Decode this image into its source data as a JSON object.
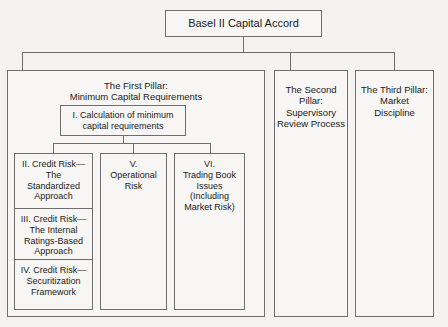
{
  "diagram": {
    "title": "Basel II Capital Accord",
    "root": {
      "label": "Basel II Capital Accord"
    },
    "pillars": [
      {
        "id": "first-pillar",
        "label": "The First Pillar:\nMinimum Capital Requirements",
        "line1": "The First Pillar:",
        "line2": "Minimum Capital Requirements",
        "children": {
          "calculation": {
            "line1": "I. Calculation of minimum",
            "line2": "capital requirements"
          },
          "columns": [
            {
              "id": "credit-risk-column",
              "cells": [
                {
                  "id": "credit-risk-standardized",
                  "line1": "II. Credit Risk—",
                  "line2": "The",
                  "line3": "Standardized",
                  "line4": "Approach"
                },
                {
                  "id": "credit-risk-irb",
                  "line1": "III. Credit Risk—",
                  "line2": "The Internal",
                  "line3": "Ratings-Based",
                  "line4": "Approach"
                },
                {
                  "id": "credit-risk-securitization",
                  "line1": "IV. Credit Risk—",
                  "line2": "Securitization",
                  "line3": "Framework"
                }
              ]
            },
            {
              "id": "operational-risk-column",
              "line1": "V.",
              "line2": "Operational",
              "line3": "Risk"
            },
            {
              "id": "trading-book-column",
              "line1": "VI.",
              "line2": "Trading Book",
              "line3": "Issues",
              "line4": "(Including",
              "line5": "Market Risk)"
            }
          ]
        }
      },
      {
        "id": "second-pillar",
        "line1": "The Second",
        "line2": "Pillar:",
        "line3": "Supervisory",
        "line4": "Review Process"
      },
      {
        "id": "third-pillar",
        "line1": "The Third Pillar:",
        "line2": "Market",
        "line3": "Discipline"
      }
    ],
    "colors": {
      "background": "#f4f3f1",
      "box_fill": "#f7f6f4",
      "line": "#6e6e6e",
      "text": "#1a1a1a"
    }
  }
}
